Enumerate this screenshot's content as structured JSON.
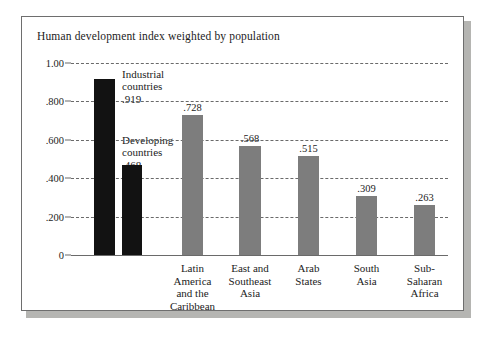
{
  "chart_data": {
    "type": "bar",
    "title": "Human development index weighted by population",
    "xlabel": "",
    "ylabel": "",
    "ylim": [
      0,
      1.0
    ],
    "grid": true,
    "legend": "none",
    "ytick_labels": [
      "1.00",
      ".800",
      ".600",
      ".400",
      ".200",
      "0"
    ],
    "ytick_values": [
      1.0,
      0.8,
      0.6,
      0.4,
      0.2,
      0
    ],
    "categories": [
      "Industrial countries",
      "Developing countries",
      "Latin America and the Caribbean",
      "East and Southeast Asia",
      "Arab States",
      "South Asia",
      "Sub-Saharan Africa"
    ],
    "values": [
      0.919,
      0.468,
      0.728,
      0.568,
      0.515,
      0.309,
      0.263
    ],
    "value_labels": [
      ".919",
      ".468",
      ".728",
      ".568",
      ".515",
      ".309",
      ".263"
    ],
    "bars": [
      {
        "name": "industrial-countries",
        "value": 0.919,
        "value_label": ".919",
        "color": "#121212",
        "label_style": "callout",
        "callout_lines": [
          "Industrial",
          "countries",
          ".919"
        ],
        "axis_label_lines": []
      },
      {
        "name": "developing-countries",
        "value": 0.468,
        "value_label": ".468",
        "color": "#121212",
        "label_style": "callout",
        "callout_lines": [
          "Developing",
          "countries",
          ".468"
        ],
        "axis_label_lines": []
      },
      {
        "name": "latin-america-and-the-caribbean",
        "value": 0.728,
        "value_label": ".728",
        "color": "#7d7d7d",
        "label_style": "axis",
        "callout_lines": [],
        "axis_label_lines": [
          "Latin",
          "America",
          "and the",
          "Caribbean"
        ]
      },
      {
        "name": "east-and-southeast-asia",
        "value": 0.568,
        "value_label": ".568",
        "color": "#7d7d7d",
        "label_style": "axis",
        "callout_lines": [],
        "axis_label_lines": [
          "East and",
          "Southeast",
          "Asia"
        ]
      },
      {
        "name": "arab-states",
        "value": 0.515,
        "value_label": ".515",
        "color": "#7d7d7d",
        "label_style": "axis",
        "callout_lines": [],
        "axis_label_lines": [
          "Arab",
          "States"
        ]
      },
      {
        "name": "south-asia",
        "value": 0.309,
        "value_label": ".309",
        "color": "#7d7d7d",
        "label_style": "axis",
        "callout_lines": [],
        "axis_label_lines": [
          "South",
          "Asia"
        ]
      },
      {
        "name": "sub-saharan-africa",
        "value": 0.263,
        "value_label": ".263",
        "color": "#7d7d7d",
        "label_style": "axis",
        "callout_lines": [],
        "axis_label_lines": [
          "Sub-",
          "Saharan",
          "Africa"
        ]
      }
    ],
    "colors": {
      "bar_dark": "#121212",
      "bar_gray": "#7d7d7d",
      "axis": "#6a6a6a",
      "frame": "#6e6e6e",
      "shadow": "#b5b5b2",
      "background": "#ffffff",
      "text": "#1c1c1c"
    }
  },
  "callouts": {
    "industrial": {
      "line1": "Industrial",
      "line2": "countries",
      "line3": ".919"
    },
    "developing": {
      "line1": "Developing",
      "line2": "countries",
      "line3": ".468"
    }
  }
}
